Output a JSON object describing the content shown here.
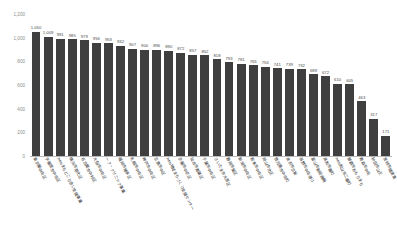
{
  "chart_data": {
    "type": "bar",
    "title": "",
    "xlabel": "",
    "ylabel": "",
    "ylim": [
      0,
      1200
    ],
    "y_ticks": [
      "0",
      "200",
      "400",
      "600",
      "800",
      "1,000",
      "1,200"
    ],
    "grid": false,
    "legend": null,
    "orientation": "vertical",
    "bar_color": "#3f3f3f",
    "sorted": "descending",
    "categories": [
      "東京都中央区",
      "宇都宮市中央区",
      "neoまちどころ会い支援事業",
      "横浜市港北区",
      "名古屋市中村区",
      "大阪市中央区",
      "ーク・クリニック事業",
      "福岡市博多区",
      "札幌市中央区",
      "神戸市中央区",
      "広島市中区",
      "neo地域まちづくり支援センター",
      "京都市中京区",
      "仙台市青葉区",
      "千葉市中央区",
      "さいたま市大宮区",
      "静岡市葵区",
      "新潟市中央区",
      "熊本市中央区",
      "岡山市北区",
      "鹿児島市中央町",
      "金沢市広坂",
      "長野市中央通り",
      "富山市新総曲輪",
      "高松市番町",
      "neo松山市二番町",
      "那覇市おもろまち",
      "青森市中央",
      "秋田市山王",
      "宮崎市橘通東"
    ],
    "values": [
      1050,
      1009,
      991,
      985,
      979,
      956,
      953,
      932,
      907,
      900,
      896,
      890,
      872,
      857,
      852,
      818,
      793,
      781,
      765,
      756,
      741,
      739,
      732,
      689,
      672,
      610,
      605,
      463,
      317,
      171
    ],
    "value_labels": [
      "1,050",
      "1,009",
      "991",
      "985",
      "979",
      "956",
      "953",
      "932",
      "907",
      "900",
      "896",
      "890",
      "872",
      "857",
      "852",
      "818",
      "793",
      "781",
      "765",
      "756",
      "741",
      "739",
      "732",
      "689",
      "672",
      "610",
      "605",
      "463",
      "317",
      "171"
    ]
  }
}
